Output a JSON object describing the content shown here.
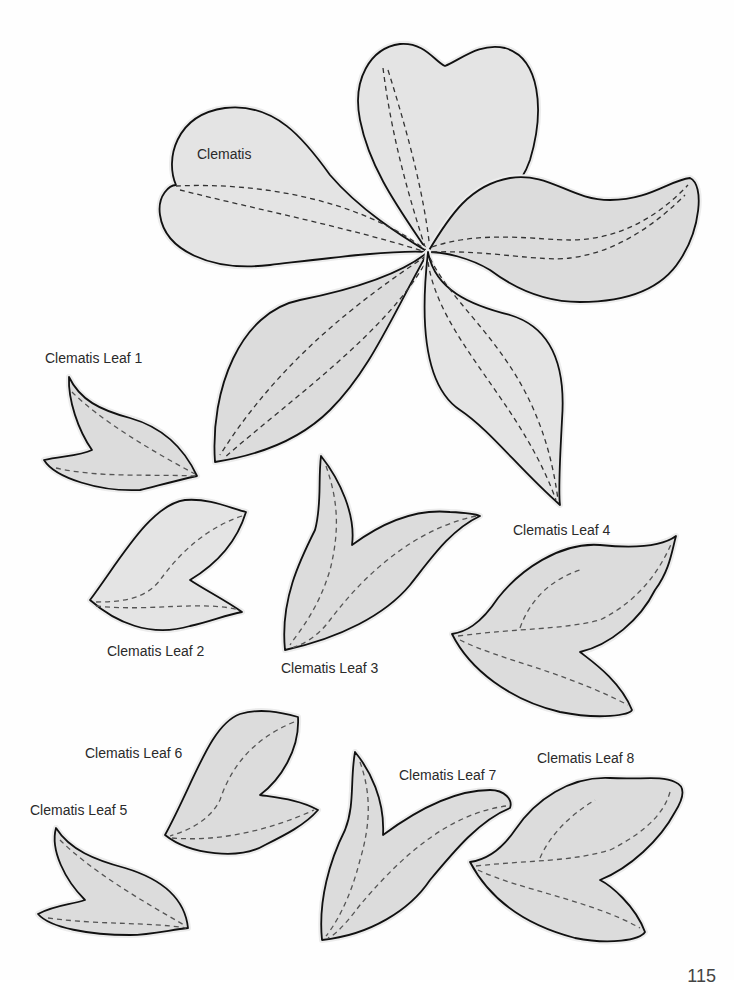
{
  "document": {
    "page_number": "115",
    "background_color": "#ffffff",
    "shape_fill_color": "#dcdcdc",
    "outline_color": "#111111",
    "dashed_line_color": "#555555"
  },
  "templates": [
    {
      "id": "clematis",
      "label": "Clematis",
      "type": "flower",
      "petals": 5
    },
    {
      "id": "leaf1",
      "label": "Clematis Leaf 1",
      "type": "leaf"
    },
    {
      "id": "leaf2",
      "label": "Clematis Leaf 2",
      "type": "leaf"
    },
    {
      "id": "leaf3",
      "label": "Clematis Leaf 3",
      "type": "leaf"
    },
    {
      "id": "leaf4",
      "label": "Clematis Leaf 4",
      "type": "leaf"
    },
    {
      "id": "leaf5",
      "label": "Clematis Leaf 5",
      "type": "leaf"
    },
    {
      "id": "leaf6",
      "label": "Clematis Leaf 6",
      "type": "leaf"
    },
    {
      "id": "leaf7",
      "label": "Clematis Leaf 7",
      "type": "leaf"
    },
    {
      "id": "leaf8",
      "label": "Clematis Leaf 8",
      "type": "leaf"
    }
  ]
}
